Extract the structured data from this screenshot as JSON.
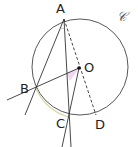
{
  "figure": {
    "type": "geometry-diagram",
    "circle": {
      "label": "𝒞",
      "center_label": "O",
      "cx": 80,
      "cy": 67,
      "r": 48,
      "stroke": "#444444"
    },
    "points": {
      "A": {
        "label": "A",
        "x": 64,
        "y": 19
      },
      "B": {
        "label": "B",
        "x": 36,
        "y": 88
      },
      "C": {
        "label": "C",
        "x": 69,
        "y": 117
      },
      "D": {
        "label": "D",
        "x": 96,
        "y": 115
      },
      "O": {
        "label": "O",
        "x": 79,
        "y": 67
      }
    },
    "segments": [
      {
        "name": "line-AB",
        "style": "solid"
      },
      {
        "name": "line-AC",
        "style": "solid"
      },
      {
        "name": "line-BO",
        "style": "solid"
      },
      {
        "name": "line-CO",
        "style": "solid"
      },
      {
        "name": "line-AD",
        "style": "dashed"
      }
    ],
    "highlights": {
      "angle_BOC_fill": "#f2d6ef",
      "arc_BC_stroke": "#d9d9a6"
    }
  }
}
